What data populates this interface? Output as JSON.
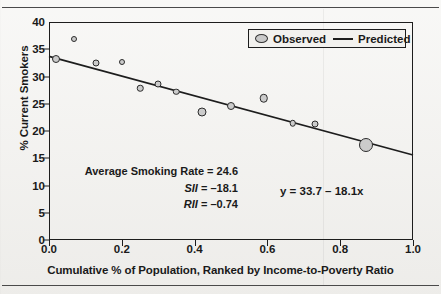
{
  "figure": {
    "rules": {
      "top": "horizontal-rule",
      "bottom": "horizontal-rule"
    }
  },
  "legend": {
    "position": "top-right-inside",
    "items": [
      {
        "label": "Observed",
        "marker": "circle-marker-icon"
      },
      {
        "label": "Predicted",
        "marker": "line-marker-icon"
      }
    ]
  },
  "annotations": {
    "avg_rate": "Average Smoking Rate =  24.6",
    "sii_name": "SII",
    "sii_value": " = –18.1",
    "rii_name": "RII",
    "rii_value": " = –0.74",
    "equation": "y = 33.7 – 18.1x"
  },
  "chart_data": {
    "type": "scatter",
    "title": "",
    "xlabel": "Cumulative % of Population, Ranked by Income-to-Poverty Ratio",
    "ylabel": "% Current Smokers",
    "xlim": [
      0.0,
      1.0
    ],
    "ylim": [
      0,
      40
    ],
    "xticks": [
      0.0,
      0.2,
      0.4,
      0.6,
      0.8,
      1.0
    ],
    "xticklabels": [
      "0.0",
      "0.2",
      "0.4",
      "0.6",
      "0.8",
      "1.0"
    ],
    "yticks": [
      0,
      5,
      10,
      15,
      20,
      25,
      30,
      35,
      40
    ],
    "yticklabels": [
      "0",
      "5",
      "10",
      "15",
      "20",
      "25",
      "30",
      "35",
      "40"
    ],
    "grid": false,
    "series": [
      {
        "name": "Observed",
        "type": "scatter",
        "marker": "circle",
        "facecolor": "#cbcbcb",
        "edgecolor": "#2b2b2b",
        "points": [
          {
            "x": 0.02,
            "y": 33.3,
            "size": 8
          },
          {
            "x": 0.07,
            "y": 36.8,
            "size": 6
          },
          {
            "x": 0.13,
            "y": 32.5,
            "size": 7
          },
          {
            "x": 0.2,
            "y": 32.7,
            "size": 6
          },
          {
            "x": 0.25,
            "y": 27.8,
            "size": 6.5
          },
          {
            "x": 0.3,
            "y": 28.6,
            "size": 7
          },
          {
            "x": 0.35,
            "y": 27.2,
            "size": 6.5
          },
          {
            "x": 0.42,
            "y": 23.4,
            "size": 9
          },
          {
            "x": 0.5,
            "y": 24.5,
            "size": 8
          },
          {
            "x": 0.59,
            "y": 26.0,
            "size": 8.5
          },
          {
            "x": 0.67,
            "y": 21.4,
            "size": 6.5
          },
          {
            "x": 0.73,
            "y": 21.2,
            "size": 7
          },
          {
            "x": 0.87,
            "y": 17.5,
            "size": 14
          }
        ]
      },
      {
        "name": "Predicted",
        "type": "line",
        "color": "#1d1d1d",
        "intercept": 33.7,
        "slope": -18.1,
        "x": [
          0.0,
          1.0
        ],
        "y": [
          33.7,
          15.6
        ]
      }
    ]
  }
}
